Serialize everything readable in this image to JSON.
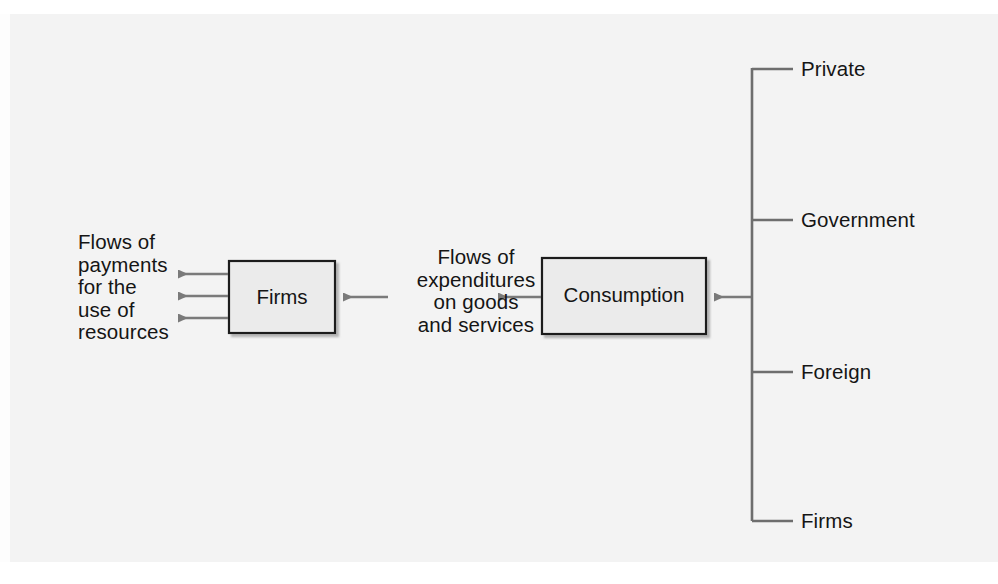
{
  "diagram": {
    "background_color": "#f3f3f3",
    "line_color": "#6e6e6e",
    "box_border_color": "#1f1f1f",
    "box_fill_color": "#ebebeb",
    "text_color": "#151515",
    "boxes": [
      {
        "id": "firms",
        "label": "Firms"
      },
      {
        "id": "consumption",
        "label": "Consumption"
      }
    ],
    "annotations": {
      "left_flow": "Flows of\npayments\nfor the\nuse of\nresources",
      "middle_flow": "Flows of\nexpenditures\non goods\nand services"
    },
    "bracket_items": [
      {
        "label": "Private"
      },
      {
        "label": "Government"
      },
      {
        "label": "Foreign"
      },
      {
        "label": "Firms"
      }
    ],
    "arrows": [
      {
        "name": "firms-to-payments-1",
        "direction": "left"
      },
      {
        "name": "firms-to-payments-2",
        "direction": "left"
      },
      {
        "name": "firms-to-payments-3",
        "direction": "left"
      },
      {
        "name": "expenditures-to-firms",
        "direction": "left"
      },
      {
        "name": "consumption-to-expenditures",
        "direction": "left"
      },
      {
        "name": "bracket-to-consumption",
        "direction": "left"
      }
    ]
  }
}
